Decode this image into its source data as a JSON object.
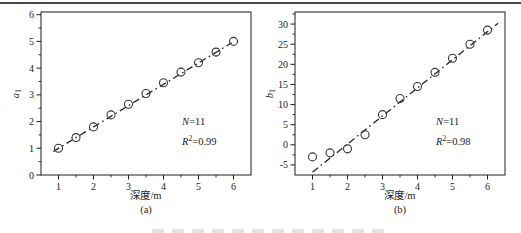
{
  "page": {
    "background": "#ffffff",
    "top_rule_color": "#4a4a4a",
    "axis_color": "#1c1c1c",
    "marker_color": "#333333",
    "line_color": "#222222"
  },
  "chart_data": [
    {
      "type": "scatter",
      "panel_label": "(a)",
      "xlabel": "深度/m",
      "ylabel": {
        "base": "a",
        "sub": "1"
      },
      "x": [
        1,
        1.5,
        2,
        2.5,
        3,
        3.5,
        4,
        4.5,
        5,
        5.5,
        6
      ],
      "y": [
        1.0,
        1.4,
        1.8,
        2.25,
        2.65,
        3.05,
        3.45,
        3.85,
        4.2,
        4.6,
        5.0
      ],
      "fit_line": {
        "style": "dash-dot",
        "x1": 0.85,
        "y1": 0.88,
        "x2": 5.95,
        "y2": 4.95
      },
      "xlim": [
        0.5,
        6.5
      ],
      "ylim": [
        0,
        6.1
      ],
      "xticks": [
        1,
        2,
        3,
        4,
        5,
        6
      ],
      "yticks": [
        0,
        1,
        2,
        3,
        4,
        5,
        6
      ],
      "minor_x_step": 0.5,
      "minor_y_step": 0.5,
      "legend_position": "none",
      "grid": false,
      "annotations": [
        {
          "var": "N",
          "sup": "",
          "rest": "=11"
        },
        {
          "var": "R",
          "sup": "2",
          "rest": "=0.99"
        }
      ]
    },
    {
      "type": "scatter",
      "panel_label": "(b)",
      "xlabel": "深度/m",
      "ylabel": {
        "base": "b",
        "sub": "1"
      },
      "x": [
        1,
        1.5,
        2,
        2.5,
        3,
        3.5,
        4,
        4.5,
        5,
        5.5,
        6
      ],
      "y": [
        -3,
        -2,
        -1,
        2.5,
        7.5,
        11.5,
        14.5,
        18,
        21.5,
        25,
        28.5
      ],
      "fit_line": {
        "style": "dash-dot",
        "x1": 1.0,
        "y1": -6.8,
        "x2": 6.3,
        "y2": 30.2
      },
      "xlim": [
        0.5,
        6.5
      ],
      "ylim": [
        -7.5,
        33
      ],
      "xticks": [
        1,
        2,
        3,
        4,
        5,
        6
      ],
      "yticks": [
        -5,
        0,
        5,
        10,
        15,
        20,
        25,
        30
      ],
      "minor_x_step": 0.5,
      "minor_y_step": 2.5,
      "legend_position": "none",
      "grid": false,
      "annotations": [
        {
          "var": "N",
          "sup": "",
          "rest": "=11"
        },
        {
          "var": "R",
          "sup": "2",
          "rest": "=0.98"
        }
      ]
    }
  ]
}
